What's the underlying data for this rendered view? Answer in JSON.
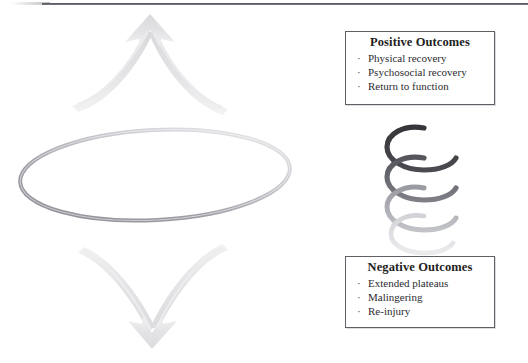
{
  "figure": {
    "title": "",
    "background_color": "#ffffff",
    "divider": {
      "name": "top-horizontal-rule",
      "color": "#4a4a50"
    }
  },
  "boxes": [
    {
      "id": "positive",
      "title": "Positive Outcomes",
      "border_color": "#5f5f66",
      "items": [
        "Physical recovery",
        "Psychosocial recovery",
        "Return to function"
      ],
      "bullet": "·"
    },
    {
      "id": "negative",
      "title": "Negative Outcomes",
      "border_color": "#5f5f66",
      "items": [
        "Extended plateaus",
        "Malingering",
        "Re-injury"
      ],
      "bullet": "·"
    }
  ],
  "graphics": {
    "up_arrow": {
      "name": "upward-curved-arrow",
      "color": "#e2e2e4",
      "direction": "up"
    },
    "down_arrow": {
      "name": "downward-curved-arrow",
      "color": "#e2e2e4",
      "direction": "down"
    },
    "ellipse": {
      "name": "horizontal-ellipse-loop",
      "color_dark": "#8f9096",
      "color_light": "#e4e4e7"
    },
    "spiral": {
      "name": "descending-spiral-coil",
      "color_dark": "#3a3a3f",
      "color_light": "#ededf0",
      "coils": 4
    }
  }
}
